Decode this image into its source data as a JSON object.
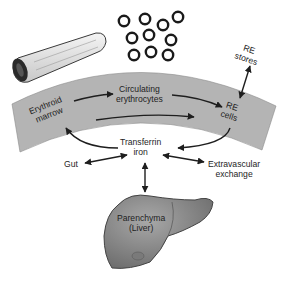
{
  "diagram": {
    "type": "iron-cycle-flow",
    "nodes": {
      "erythroid_marrow": {
        "line1": "Erythroid",
        "line2": "marrow"
      },
      "circulating_erythrocytes": {
        "line1": "Circulating",
        "line2": "erythrocytes"
      },
      "re_cells": {
        "line1": "RE",
        "line2": "cells"
      },
      "re_stores": {
        "line1": "RE",
        "line2": "stores"
      },
      "transferrin_iron": {
        "line1": "Transferrin",
        "line2": "iron"
      },
      "gut": {
        "label": "Gut"
      },
      "extravascular_exchange": {
        "line1": "Extravascular",
        "line2": "exchange"
      },
      "parenchyma": {
        "line1": "Parenchyma",
        "line2": "(Liver)"
      }
    },
    "edges": [
      {
        "from": "Erythroid marrow",
        "to": "Circulating erythrocytes",
        "direction": "one-way"
      },
      {
        "from": "Circulating erythrocytes",
        "to": "RE cells",
        "direction": "one-way"
      },
      {
        "from": "Erythroid marrow",
        "to": "RE cells",
        "direction": "one-way",
        "note": "lower arrow in band"
      },
      {
        "from": "RE cells",
        "to": "Transferrin iron",
        "direction": "one-way"
      },
      {
        "from": "Transferrin iron",
        "to": "Erythroid marrow",
        "direction": "one-way"
      },
      {
        "from": "RE cells",
        "to": "RE stores",
        "direction": "two-way"
      },
      {
        "from": "Transferrin iron",
        "to": "Gut",
        "direction": "two-way"
      },
      {
        "from": "Transferrin iron",
        "to": "Extravascular exchange",
        "direction": "two-way"
      },
      {
        "from": "Transferrin iron",
        "to": "Parenchyma (Liver)",
        "direction": "two-way"
      }
    ],
    "illustrations": [
      "bone",
      "red-blood-cells",
      "curved-band",
      "liver"
    ],
    "colors": {
      "band": "#b4b4b4",
      "liver": "#8a8a8a",
      "ink": "#1e1e1e"
    }
  }
}
